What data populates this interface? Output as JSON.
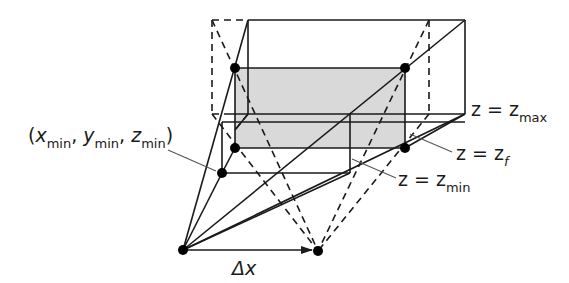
{
  "diagram": {
    "type": "stereo-viewing-frustum",
    "colors": {
      "stroke": "#1a1a1a",
      "leader": "#555555",
      "shade": "#d9d9d9",
      "point": "#000000"
    },
    "labels": {
      "corner": {
        "open": "(",
        "x": "x",
        "y": "y",
        "z": "z",
        "sub": "min",
        "sep": ",",
        "close": ")"
      },
      "z_max": {
        "lhs": "z = z",
        "sub": "max"
      },
      "z_f": {
        "lhs": "z = z",
        "sub": "f"
      },
      "z_min": {
        "lhs": "z = z",
        "sub": "min"
      },
      "delta_x": "Δx"
    },
    "eye_points": [
      {
        "name": "left-eye",
        "x": 183,
        "y": 250
      },
      {
        "name": "right-eye",
        "x": 318,
        "y": 251
      }
    ],
    "planes": [
      {
        "name": "z-max",
        "left": 248,
        "top": 20,
        "right": 465,
        "bottom": 122
      },
      {
        "name": "z-f",
        "left": 235,
        "top": 68,
        "right": 405,
        "bottom": 148,
        "shaded": true
      },
      {
        "name": "z-min",
        "left": 222,
        "top": 115,
        "right": 350,
        "bottom": 173
      }
    ]
  }
}
